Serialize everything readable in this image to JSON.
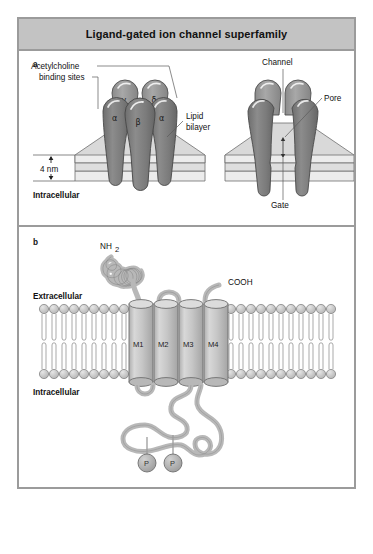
{
  "figure": {
    "title": "Ligand-gated ion channel superfamily",
    "border_color": "#9b9b9b",
    "title_bg": "#c3c3c3"
  },
  "panel_a": {
    "letter": "a",
    "labels": {
      "acetylcholine_line1": "Acetylcholine",
      "acetylcholine_line2": "binding sites",
      "lipid_line1": "Lipid",
      "lipid_line2": "bilayer",
      "scale": "4 nm",
      "intracellular": "Intracellular",
      "channel": "Channel",
      "pore": "Pore",
      "gate": "Gate"
    },
    "subunits": [
      {
        "name": "gamma",
        "symbol": "γ"
      },
      {
        "name": "delta",
        "symbol": "δ"
      },
      {
        "name": "alpha-left",
        "symbol": "α"
      },
      {
        "name": "beta",
        "symbol": "β"
      },
      {
        "name": "alpha-right",
        "symbol": "α"
      }
    ],
    "colors": {
      "subunit_front": "#7f7f7f",
      "subunit_back": "#9d9d9d",
      "membrane_top": "#d6d6d6",
      "membrane_face": "#eaeaea",
      "outline": "#4a4a4a"
    }
  },
  "panel_b": {
    "letter": "b",
    "labels": {
      "nh2": "NH",
      "nh2_sub": "2",
      "cooh": "COOH",
      "extracellular": "Extracellular",
      "intracellular": "Intracellular"
    },
    "helices": [
      {
        "name": "M1",
        "label": "M1"
      },
      {
        "name": "M2",
        "label": "M2"
      },
      {
        "name": "M3",
        "label": "M3"
      },
      {
        "name": "M4",
        "label": "M4"
      }
    ],
    "phosphates": [
      {
        "name": "phosphate-1",
        "label": "P"
      },
      {
        "name": "phosphate-2",
        "label": "P"
      }
    ],
    "colors": {
      "helix": "#c4c4c4",
      "chain": "#b5b5b5",
      "lipid_head": "#c9c9c9",
      "outline": "#6e6e6e"
    }
  }
}
